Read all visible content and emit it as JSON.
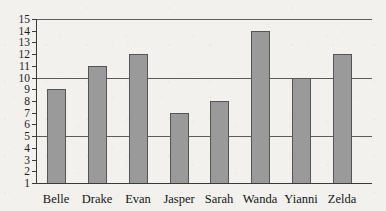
{
  "chart_data": {
    "type": "bar",
    "title": "",
    "subtitle": "",
    "xlabel": "",
    "ylabel": "",
    "categories": [
      "Belle",
      "Drake",
      "Evan",
      "Jasper",
      "Sarah",
      "Wanda",
      "Yianni",
      "Zelda"
    ],
    "values": [
      9,
      11,
      12,
      7,
      8,
      14,
      10,
      12
    ],
    "ylim": [
      1,
      15
    ],
    "y_ticks": [
      1,
      2,
      3,
      4,
      5,
      6,
      7,
      8,
      9,
      10,
      11,
      12,
      13,
      14,
      15
    ],
    "y_tick_labels": [
      "1",
      "2",
      "3",
      "4",
      "5",
      "6",
      "7",
      "8",
      "9",
      "10",
      "11",
      "12",
      "13",
      "14",
      "15"
    ],
    "gridlines": [
      5,
      10,
      15
    ],
    "grid": true,
    "legend": null,
    "legend_position": "none",
    "annotations": []
  },
  "style": {
    "background_color": "#f2f1ee",
    "bar_fill_color": "#9a9a9a",
    "bar_border_color": "#555555",
    "axis_color": "#3a3a3a",
    "gridline_color": "#5c5c5c",
    "label_color": "#141414"
  }
}
